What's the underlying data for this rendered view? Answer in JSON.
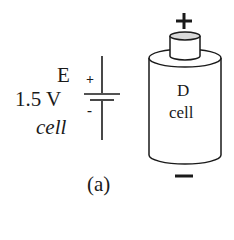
{
  "symbol": {
    "label_e": "E",
    "voltage": "1.5 V",
    "type": "cell",
    "plus": "+",
    "minus": "-"
  },
  "battery": {
    "line1": "D",
    "line2": "cell",
    "plus": "+",
    "minus": "−"
  },
  "caption": "(a)"
}
